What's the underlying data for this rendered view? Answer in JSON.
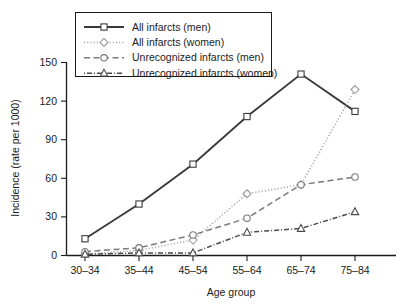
{
  "chart_data": {
    "type": "line",
    "title": "",
    "xlabel": "Age group",
    "ylabel": "Incidence (rate per 1000)",
    "categories": [
      "30–34",
      "35–44",
      "45–54",
      "55–64",
      "65–74",
      "75–84"
    ],
    "ylim": [
      0,
      150
    ],
    "yticks": [
      0,
      30,
      60,
      90,
      120,
      150
    ],
    "grid": false,
    "legend_position": "top-center",
    "series": [
      {
        "name": "All infarcts (men)",
        "values": [
          13,
          40,
          71,
          108,
          141,
          112
        ],
        "color": "#3a3a3a",
        "marker": "square",
        "dash": "solid"
      },
      {
        "name": "All infarcts (women)",
        "values": [
          1,
          4,
          12,
          48,
          55,
          129
        ],
        "color": "#9a9a9a",
        "marker": "diamond",
        "dash": "dotted"
      },
      {
        "name": "Unrecognized infarcts (men)",
        "values": [
          3,
          6,
          16,
          29,
          55,
          61
        ],
        "color": "#7a7a7a",
        "marker": "circle",
        "dash": "dashed"
      },
      {
        "name": "Unrecognized infarcts (women)",
        "values": [
          1,
          2,
          2,
          18,
          21,
          34
        ],
        "color": "#4a4a4a",
        "marker": "triangle",
        "dash": "dashdot"
      }
    ]
  },
  "legend": {
    "items": [
      {
        "label": "All infarcts (men)"
      },
      {
        "label": "All infarcts (women)"
      },
      {
        "label": "Unrecognized infarcts (men)"
      },
      {
        "label": "Unrecognized infarcts (women)"
      }
    ]
  },
  "axes": {
    "y_title": "Incidence (rate per 1000)",
    "x_title": "Age group",
    "y_tick_labels": [
      "0",
      "30",
      "60",
      "90",
      "120",
      "150"
    ],
    "x_tick_labels": [
      "30–34",
      "35–44",
      "45–54",
      "55–64",
      "65–74",
      "75–84"
    ]
  }
}
